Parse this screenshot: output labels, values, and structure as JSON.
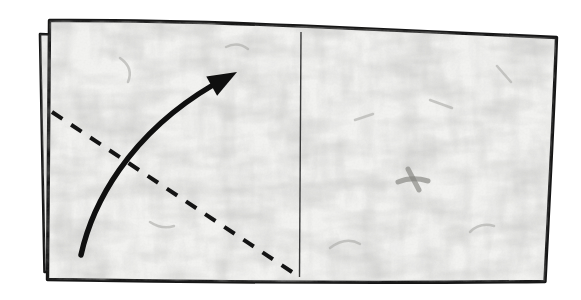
{
  "diagram": {
    "type": "origami-instruction-step",
    "text_labels": [],
    "colors": {
      "background": "#ffffff",
      "paper_fill": "#f2f2f0",
      "outline": "#161616",
      "crease_line": "#3a3a3a",
      "fold_line": "#141414",
      "arrow": "#0f0f0f",
      "texture_fiber": "#9b9b97"
    },
    "line_styles": {
      "fold_line": "dashed",
      "crease_line": "thin solid",
      "arrow": "curved solid with filled triangular head"
    }
  },
  "shapes": {
    "back_sheet": "M 40,34 L 299,45 L 538,52 L 534,270 L 44.5,272 Z",
    "front_sheet": "M 49.5,20.5 C 135,20 220,22.5 301,26 C 392,29.8 478,33.6 556.5,37.5 C 553.5,121 549,201 545,281.5 C 377,283.2 210,282.2 47.5,279.5 C 48.2,192 48.6,106 49.5,20.5 Z",
    "crease_line": "M 301,32 L 299.5,277",
    "fold_line": "M 52,112 L 298,276",
    "arrow_shaft": "M 81,255 C 92,205 128,135 213,85",
    "arrow_head": "M 237,72 L 217.1,95.8 L 206.3,76.6 Z"
  }
}
